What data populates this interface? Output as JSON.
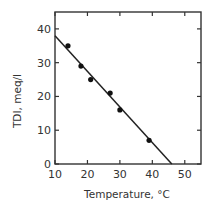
{
  "chart_data": {
    "type": "scatter",
    "title": "",
    "xlabel": "Temperature, °C",
    "ylabel": "TDI, meq/l",
    "xlim": [
      10,
      55
    ],
    "ylim": [
      0,
      45
    ],
    "xticks": [
      10,
      20,
      30,
      40,
      50
    ],
    "yticks": [
      0,
      10,
      20,
      30,
      40
    ],
    "xtick_labels": [
      "10",
      "20",
      "30",
      "40",
      "50"
    ],
    "ytick_labels": [
      "0",
      "10",
      "20",
      "30",
      "40"
    ],
    "grid": false,
    "legend": null,
    "series": [
      {
        "name": "measured",
        "type": "scatter",
        "x": [
          14,
          18,
          21,
          27,
          30,
          39
        ],
        "y": [
          35,
          29,
          25,
          21,
          16,
          7
        ]
      },
      {
        "name": "fit",
        "type": "line",
        "x": [
          10,
          46
        ],
        "y": [
          38,
          0
        ]
      }
    ]
  }
}
